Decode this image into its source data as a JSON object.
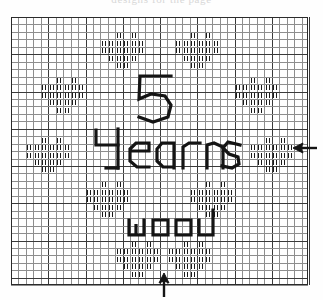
{
  "document": {
    "type": "cross-stitch-chart-scan",
    "clipped_header_text": "designs for the page",
    "background_color": "#ffffff",
    "ink_color": "#141414",
    "grid_minor_color": "#8e8e8e",
    "grid_major_color": "#3a3a3a"
  },
  "chart_region": {
    "x": 11,
    "y": 17,
    "width": 297,
    "height": 268,
    "cell_size": 7.45,
    "columns": 40,
    "rows": 36,
    "major_every": 5
  },
  "lettering": [
    {
      "name": "numeral-five",
      "text": "5",
      "row": 8,
      "col": 17
    },
    {
      "name": "word-years",
      "text": "Years",
      "row": 15,
      "col": 12
    },
    {
      "name": "word-wood",
      "text": "wood",
      "row": 25,
      "col": 14
    }
  ],
  "motifs": [
    {
      "name": "motif-top-left",
      "label": "diamond-stitch-motif",
      "center_col": 15,
      "center_row": 4
    },
    {
      "name": "motif-top-right",
      "label": "diamond-stitch-motif",
      "center_col": 25,
      "center_row": 4
    },
    {
      "name": "motif-mid-left-upper",
      "label": "diamond-stitch-motif",
      "center_col": 7,
      "center_row": 10
    },
    {
      "name": "motif-mid-right-upper",
      "label": "diamond-stitch-motif",
      "center_col": 33,
      "center_row": 10
    },
    {
      "name": "motif-mid-left-lower",
      "label": "diamond-stitch-motif",
      "center_col": 5,
      "center_row": 18
    },
    {
      "name": "motif-mid-right-lower",
      "label": "diamond-stitch-motif",
      "center_col": 35,
      "center_row": 18
    },
    {
      "name": "motif-bottom-left",
      "label": "diamond-stitch-motif",
      "center_col": 13,
      "center_row": 24
    },
    {
      "name": "motif-bottom-right",
      "label": "diamond-stitch-motif",
      "center_col": 27,
      "center_row": 24
    },
    {
      "name": "motif-lower-left",
      "label": "diamond-stitch-motif",
      "center_col": 17,
      "center_row": 32
    },
    {
      "name": "motif-lower-right",
      "label": "diamond-stitch-motif",
      "center_col": 24,
      "center_row": 32
    }
  ],
  "annotations": [
    {
      "name": "arrow-left-pointing",
      "direction": "left",
      "x": 293,
      "y": 147,
      "length": 18,
      "note": "row indicator at right margin"
    },
    {
      "name": "arrow-up-pointing",
      "direction": "up",
      "x": 163,
      "y": 275,
      "length": 18,
      "note": "column indicator at bottom margin"
    }
  ]
}
